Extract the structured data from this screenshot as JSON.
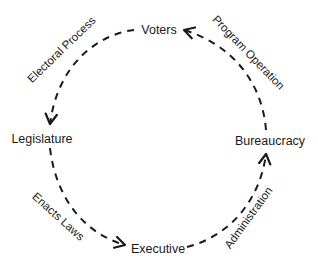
{
  "diagram": {
    "type": "cycle",
    "nodes": {
      "voters": "Voters",
      "legislature": "Legislature",
      "executive": "Executive",
      "bureaucracy": "Bureaucracy"
    },
    "edges": {
      "electoral_process": {
        "label": "Electoral Process",
        "from": "Voters",
        "to": "Legislature"
      },
      "enacts_laws": {
        "label": "Enacts Laws",
        "from": "Legislature",
        "to": "Executive"
      },
      "administration": {
        "label": "Administration",
        "from": "Executive",
        "to": "Bureaucracy"
      },
      "program_operation": {
        "label": "Program Operation",
        "from": "Bureaucracy",
        "to": "Voters"
      }
    },
    "colors": {
      "stroke": "#1a1a1a",
      "text": "#1a1a1a",
      "background": "#ffffff"
    }
  }
}
